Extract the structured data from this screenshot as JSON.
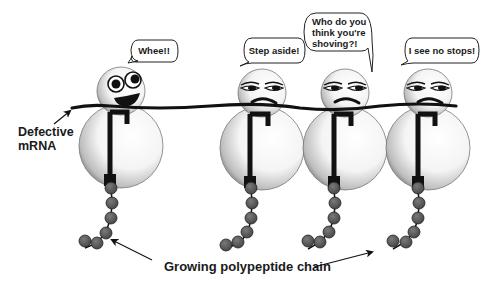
{
  "labels": {
    "mrna_line1": "Defective",
    "mrna_line2": "mRNA",
    "chain": "Growing polypeptide chain"
  },
  "ribosomes": [
    {
      "id": "ribosome-1",
      "mood": "happy",
      "speech": [
        "Whee!!"
      ]
    },
    {
      "id": "ribosome-2",
      "mood": "annoyed",
      "speech": [
        "Step aside!"
      ]
    },
    {
      "id": "ribosome-3",
      "mood": "annoyed",
      "speech": [
        "Who do you",
        "think you're",
        "shoving?!"
      ]
    },
    {
      "id": "ribosome-4",
      "mood": "annoyed",
      "speech": [
        "I see no stops!"
      ]
    }
  ],
  "colors": {
    "ink": "#111111",
    "bead": "#5a5a5a",
    "sphere_light": "#ffffff",
    "sphere_dark": "#8a8a8a"
  }
}
